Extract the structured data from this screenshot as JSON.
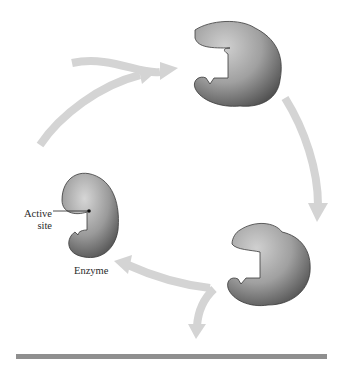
{
  "diagram": {
    "type": "enzyme-catalytic-cycle",
    "labels": {
      "active_site_line1": "Active",
      "active_site_line2": "site",
      "enzyme": "Enzyme"
    },
    "elements": {
      "enzymes": [
        {
          "id": "enzyme-free",
          "position": "left",
          "state": "free enzyme"
        },
        {
          "id": "enzyme-top",
          "position": "top-right",
          "state": "enzyme"
        },
        {
          "id": "enzyme-bottom",
          "position": "bottom-right",
          "state": "enzyme"
        }
      ],
      "arrows": [
        {
          "id": "arrow-substrate-in",
          "from": "left-edge",
          "to": "enzyme-top"
        },
        {
          "id": "arrow-cycle-left-to-top",
          "from": "enzyme-free",
          "to": "enzyme-top"
        },
        {
          "id": "arrow-cycle-top-to-bottom",
          "from": "enzyme-top",
          "to": "enzyme-bottom"
        },
        {
          "id": "arrow-cycle-bottom-to-left",
          "from": "enzyme-bottom",
          "to": "enzyme-free"
        },
        {
          "id": "arrow-product-out",
          "from": "enzyme-bottom",
          "to": "down"
        }
      ]
    },
    "colors": {
      "arrow": "#d4d4d4",
      "enzyme_light": "#c8c8c8",
      "enzyme_dark": "#505050",
      "outline": "#3a3a3a",
      "baseline": "#8f8f8f",
      "text": "#2a2a2a"
    }
  }
}
